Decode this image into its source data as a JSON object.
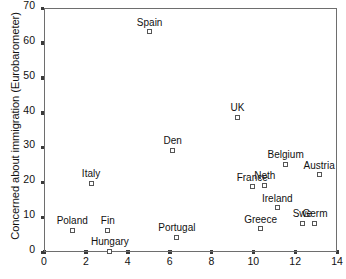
{
  "chart_data": {
    "type": "scatter",
    "title": "",
    "xlabel": "",
    "ylabel": "Concerned about immigration (Eurobarometer)",
    "xlim": [
      0,
      14
    ],
    "ylim": [
      0,
      70
    ],
    "xticks": [
      0,
      2,
      4,
      6,
      8,
      10,
      12,
      14
    ],
    "yticks": [
      0,
      10,
      20,
      30,
      40,
      50,
      60,
      70
    ],
    "grid": false,
    "legend": null,
    "marker": "open-square",
    "points": [
      {
        "label": "Spain",
        "x": 5.0,
        "y": 63.5
      },
      {
        "label": "UK",
        "x": 9.2,
        "y": 39.0
      },
      {
        "label": "Den",
        "x": 6.1,
        "y": 29.5
      },
      {
        "label": "Belgium",
        "x": 11.5,
        "y": 25.5
      },
      {
        "label": "Austria",
        "x": 13.1,
        "y": 22.5
      },
      {
        "label": "Italy",
        "x": 2.2,
        "y": 20.0
      },
      {
        "label": "France",
        "x": 9.9,
        "y": 19.0
      },
      {
        "label": "Neth",
        "x": 10.5,
        "y": 19.5
      },
      {
        "label": "Ireland",
        "x": 11.1,
        "y": 13.0
      },
      {
        "label": "Germ",
        "x": 12.9,
        "y": 8.5
      },
      {
        "label": "Swe",
        "x": 12.3,
        "y": 8.5
      },
      {
        "label": "Greece",
        "x": 10.3,
        "y": 7.0
      },
      {
        "label": "Fin",
        "x": 3.0,
        "y": 6.5
      },
      {
        "label": "Poland",
        "x": 1.3,
        "y": 6.5
      },
      {
        "label": "Portugal",
        "x": 6.3,
        "y": 4.5
      },
      {
        "label": "Hungary",
        "x": 3.1,
        "y": 0.5
      }
    ]
  },
  "caption": {
    "text": "",
    "note": "clipped at image edge"
  }
}
